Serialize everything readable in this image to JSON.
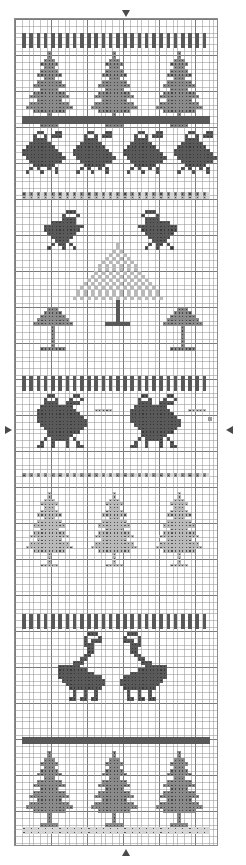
{
  "document": {
    "title": "Cross-Stitch Pattern Chart",
    "type": "counted cross-stitch band sampler chart",
    "orientation": "portrait",
    "grid": {
      "cell_px": 3.6,
      "heavy_line_every": 10,
      "columns": 56,
      "rows": 229,
      "fine_line_color": "#969696",
      "heavy_line_color": "#3c3c3c",
      "background_color": "#ffffff",
      "frame_border_color": "#8c8c8c"
    },
    "markers": [
      {
        "name": "top-center-arrow",
        "glyph": "down-arrow",
        "x_col": 30,
        "position": "top",
        "color": "#4a4a4a"
      },
      {
        "name": "bottom-center-arrow",
        "glyph": "up-arrow",
        "x_col": 30,
        "position": "bottom",
        "color": "#4a4a4a"
      },
      {
        "name": "left-center-arrow",
        "glyph": "right-arrow",
        "y_row": 114,
        "position": "left",
        "color": "#4a4a4a"
      },
      {
        "name": "right-center-arrow",
        "glyph": "left-arrow",
        "y_row": 114,
        "position": "right",
        "color": "#4a4a4a"
      }
    ],
    "thread_colors": {
      "dark": "#595959",
      "medium": "#8a8a8a",
      "light": "#b9b9b9",
      "pale": "#d6d6d6",
      "symbol_mark": "#2e2e2e"
    },
    "bands": [
      {
        "index": 1,
        "name": "vertical-dash-border-top",
        "motif": "upright stitch border",
        "shade": "dark",
        "row_start": 4,
        "row_end": 7
      },
      {
        "index": 2,
        "name": "fir-trees-row-1",
        "motif": "fir tree",
        "shade": "medium",
        "count": 3,
        "row_start": 9,
        "row_end": 26
      },
      {
        "index": 3,
        "name": "solid-band-1",
        "motif": "solid horizontal band",
        "shade": "dark",
        "row_start": 27,
        "row_end": 29
      },
      {
        "index": 4,
        "name": "hens-row",
        "motif": "hen / bird facing right",
        "shade": "dark",
        "count": 4,
        "row_start": 31,
        "row_end": 48
      },
      {
        "index": 5,
        "name": "dash-border-2",
        "motif": "dashed border",
        "shade": "medium",
        "row_start": 49,
        "row_end": 51
      },
      {
        "index": 6,
        "name": "facing-doves-row",
        "motif": "pair of doves facing in",
        "shade": "dark",
        "count": 2,
        "row_start": 53,
        "row_end": 68
      },
      {
        "index": 7,
        "name": "large-center-tree",
        "motif": "large pale fir tree",
        "shade": "pale",
        "count": 1,
        "row_start": 62,
        "row_end": 96
      },
      {
        "index": 8,
        "name": "palm-trees-row",
        "motif": "palm / broadleaf tree",
        "shade": "medium",
        "count": 3,
        "row_start": 78,
        "row_end": 96
      },
      {
        "index": 9,
        "name": "vertical-dash-border-3",
        "motif": "upright stitch border",
        "shade": "dark",
        "row_start": 99,
        "row_end": 102
      },
      {
        "index": 10,
        "name": "roosters-row",
        "motif": "rooster / peacock pair",
        "shade": "dark",
        "count": 2,
        "row_start": 104,
        "row_end": 126
      },
      {
        "index": 11,
        "name": "dash-border-4",
        "motif": "dashed border",
        "shade": "medium",
        "row_start": 127,
        "row_end": 129
      },
      {
        "index": 12,
        "name": "pale-fir-trees-row",
        "motif": "pale fir tree",
        "shade": "light",
        "count": 3,
        "row_start": 131,
        "row_end": 163
      },
      {
        "index": 13,
        "name": "vertical-dash-border-5",
        "motif": "upright stitch border",
        "shade": "dark",
        "row_start": 165,
        "row_end": 168
      },
      {
        "index": 14,
        "name": "swans-row",
        "motif": "pair of swans facing in",
        "shade": "dark",
        "count": 2,
        "row_start": 170,
        "row_end": 197
      },
      {
        "index": 15,
        "name": "solid-band-2",
        "motif": "solid horizontal band",
        "shade": "dark",
        "row_start": 199,
        "row_end": 201
      },
      {
        "index": 16,
        "name": "fir-trees-row-2",
        "motif": "fir tree",
        "shade": "medium",
        "count": 3,
        "row_start": 203,
        "row_end": 223
      },
      {
        "index": 17,
        "name": "pale-border-bottom",
        "motif": "pale dashed border",
        "shade": "pale",
        "row_start": 224,
        "row_end": 227
      }
    ]
  }
}
